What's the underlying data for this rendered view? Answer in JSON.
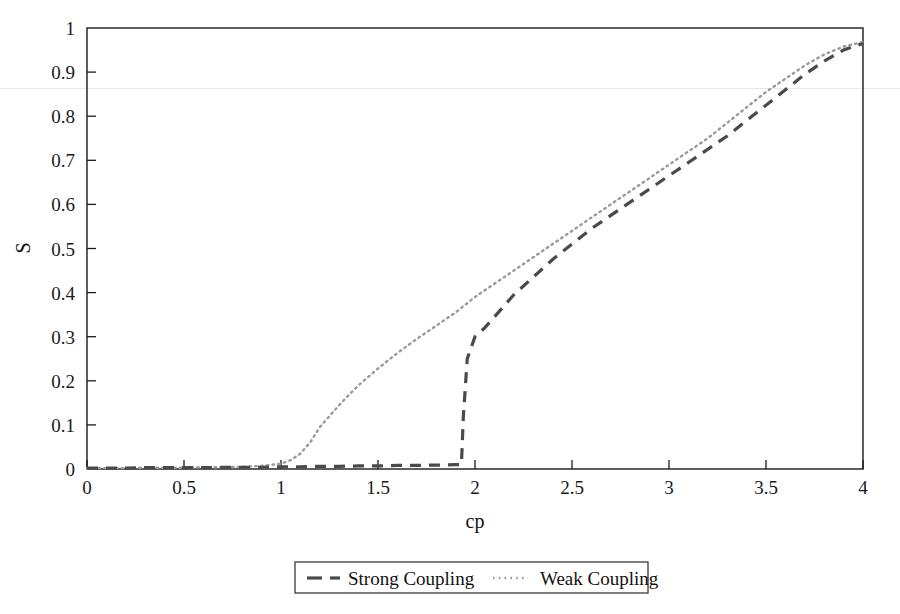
{
  "chart_data": {
    "type": "line",
    "title": "",
    "xlabel": "cp",
    "ylabel": "S",
    "xlim": [
      0,
      4
    ],
    "ylim": [
      0,
      1
    ],
    "grid": false,
    "legend_position": "below-center",
    "xticks": [
      "0",
      "0.5",
      "1",
      "1.5",
      "2",
      "2.5",
      "3",
      "3.5",
      "4"
    ],
    "xtick_values": [
      0,
      0.5,
      1,
      1.5,
      2,
      2.5,
      3,
      3.5,
      4
    ],
    "yticks": [
      "0",
      "0.1",
      "0.2",
      "0.3",
      "0.4",
      "0.5",
      "0.6",
      "0.7",
      "0.8",
      "0.9",
      "1"
    ],
    "ytick_values": [
      0,
      0.1,
      0.2,
      0.3,
      0.4,
      0.5,
      0.6,
      0.7,
      0.8,
      0.9,
      1
    ],
    "series": [
      {
        "name": "Strong Coupling",
        "style": "dashed",
        "color": "#4a4a4a",
        "x": [
          0,
          0.1,
          0.2,
          0.3,
          0.4,
          0.5,
          0.6,
          0.7,
          0.8,
          0.9,
          1.0,
          1.1,
          1.2,
          1.3,
          1.4,
          1.5,
          1.6,
          1.7,
          1.8,
          1.85,
          1.9,
          1.92,
          1.93,
          1.94,
          1.96,
          2.0,
          2.05,
          2.1,
          2.2,
          2.3,
          2.4,
          2.5,
          2.6,
          2.7,
          2.8,
          2.9,
          3.0,
          3.1,
          3.2,
          3.3,
          3.4,
          3.5,
          3.6,
          3.7,
          3.8,
          3.9,
          4.0
        ],
        "y": [
          0.002,
          0.002,
          0.002,
          0.003,
          0.003,
          0.003,
          0.003,
          0.004,
          0.004,
          0.004,
          0.005,
          0.005,
          0.006,
          0.006,
          0.007,
          0.007,
          0.008,
          0.008,
          0.009,
          0.009,
          0.01,
          0.01,
          0.01,
          0.12,
          0.25,
          0.3,
          0.32,
          0.345,
          0.395,
          0.435,
          0.475,
          0.51,
          0.545,
          0.575,
          0.605,
          0.635,
          0.665,
          0.695,
          0.725,
          0.755,
          0.79,
          0.825,
          0.86,
          0.895,
          0.925,
          0.95,
          0.965
        ]
      },
      {
        "name": "Weak Coupling",
        "style": "dotted",
        "color": "#9a9a9a",
        "x": [
          0,
          0.1,
          0.2,
          0.3,
          0.4,
          0.5,
          0.6,
          0.7,
          0.8,
          0.9,
          1.0,
          1.05,
          1.1,
          1.15,
          1.2,
          1.25,
          1.3,
          1.35,
          1.4,
          1.5,
          1.6,
          1.7,
          1.8,
          1.9,
          2.0,
          2.1,
          2.2,
          2.3,
          2.4,
          2.5,
          2.6,
          2.7,
          2.8,
          2.9,
          3.0,
          3.1,
          3.2,
          3.3,
          3.4,
          3.5,
          3.6,
          3.7,
          3.8,
          3.9,
          4.0
        ],
        "y": [
          0.002,
          0.002,
          0.002,
          0.003,
          0.003,
          0.003,
          0.004,
          0.004,
          0.005,
          0.007,
          0.012,
          0.02,
          0.035,
          0.06,
          0.095,
          0.12,
          0.145,
          0.168,
          0.19,
          0.228,
          0.263,
          0.295,
          0.325,
          0.355,
          0.39,
          0.42,
          0.45,
          0.48,
          0.51,
          0.54,
          0.57,
          0.6,
          0.63,
          0.66,
          0.69,
          0.72,
          0.75,
          0.785,
          0.82,
          0.855,
          0.885,
          0.915,
          0.94,
          0.958,
          0.968
        ]
      }
    ]
  },
  "legend": {
    "entries": [
      {
        "label": "Strong Coupling",
        "marker": "dashed-line-marker"
      },
      {
        "label": "Weak Coupling",
        "marker": "dotted-line-marker"
      }
    ]
  },
  "colors": {
    "strong_coupling": "#4a4a4a",
    "weak_coupling": "#9a9a9a",
    "axis": "#1a1a1a",
    "background": "#ffffff"
  }
}
